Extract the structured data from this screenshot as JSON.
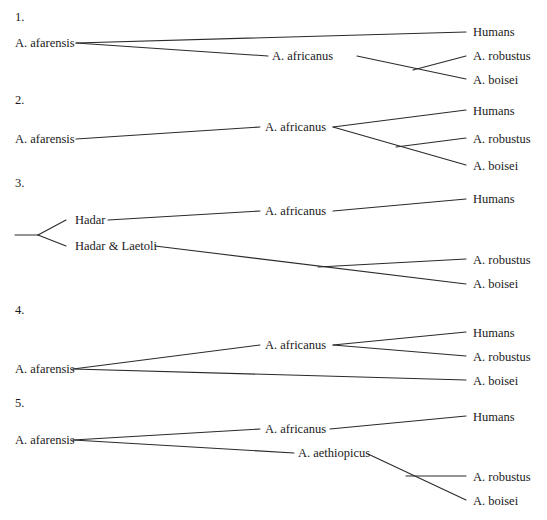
{
  "trees": [
    {
      "heading": "1.",
      "heading_pos": [
        15,
        21
      ],
      "labels": [
        {
          "text": "A. afarensis",
          "x": 15,
          "y": 47
        },
        {
          "text": "A. africanus",
          "x": 272,
          "y": 60
        },
        {
          "text": "Humans",
          "x": 473,
          "y": 36
        },
        {
          "text": "A. robustus",
          "x": 473,
          "y": 60
        },
        {
          "text": "A. boisei",
          "x": 473,
          "y": 84
        }
      ],
      "lines": [
        [
          76,
          43,
          466,
          32
        ],
        [
          76,
          43,
          268,
          56
        ],
        [
          357,
          56,
          466,
          79
        ],
        [
          413,
          70,
          466,
          56
        ]
      ]
    },
    {
      "heading": "2.",
      "heading_pos": [
        15,
        104
      ],
      "labels": [
        {
          "text": "A. afarensis",
          "x": 15,
          "y": 143
        },
        {
          "text": "A. africanus",
          "x": 265,
          "y": 131
        },
        {
          "text": "Humans",
          "x": 473,
          "y": 115
        },
        {
          "text": "A. robustus",
          "x": 473,
          "y": 143
        },
        {
          "text": "A. boisei",
          "x": 473,
          "y": 170
        }
      ],
      "lines": [
        [
          76,
          139,
          260,
          127
        ],
        [
          333,
          127,
          466,
          110
        ],
        [
          333,
          127,
          466,
          165
        ],
        [
          396,
          147,
          466,
          138
        ]
      ]
    },
    {
      "heading": "3.",
      "heading_pos": [
        15,
        187
      ],
      "labels": [
        {
          "text": "Hadar",
          "x": 75,
          "y": 224
        },
        {
          "text": "Hadar & Laetoli",
          "x": 75,
          "y": 250
        },
        {
          "text": "A. africanus",
          "x": 265,
          "y": 215
        },
        {
          "text": "Humans",
          "x": 473,
          "y": 203
        },
        {
          "text": "A. robustus",
          "x": 473,
          "y": 264
        },
        {
          "text": "A. boisei",
          "x": 473,
          "y": 288
        }
      ],
      "lines": [
        [
          15,
          235,
          38,
          235
        ],
        [
          38,
          235,
          66,
          220
        ],
        [
          38,
          235,
          66,
          246
        ],
        [
          108,
          220,
          260,
          211
        ],
        [
          333,
          211,
          466,
          199
        ],
        [
          155,
          246,
          466,
          284
        ],
        [
          318,
          267,
          466,
          259
        ]
      ]
    },
    {
      "heading": "4.",
      "heading_pos": [
        15,
        314
      ],
      "labels": [
        {
          "text": "A. afarensis",
          "x": 15,
          "y": 373
        },
        {
          "text": "A. africanus",
          "x": 265,
          "y": 349
        },
        {
          "text": "Humans",
          "x": 473,
          "y": 337
        },
        {
          "text": "A. robustus",
          "x": 473,
          "y": 361
        },
        {
          "text": "A. boisei",
          "x": 473,
          "y": 385
        }
      ],
      "lines": [
        [
          73,
          369,
          260,
          345
        ],
        [
          333,
          345,
          466,
          332
        ],
        [
          333,
          345,
          466,
          356
        ],
        [
          73,
          369,
          466,
          380
        ]
      ]
    },
    {
      "heading": "5.",
      "heading_pos": [
        15,
        407
      ],
      "labels": [
        {
          "text": "A. afarensis",
          "x": 15,
          "y": 444
        },
        {
          "text": "A. africanus",
          "x": 265,
          "y": 433
        },
        {
          "text": "A. aethiopicus",
          "x": 298,
          "y": 457
        },
        {
          "text": "Humans",
          "x": 473,
          "y": 421
        },
        {
          "text": "A. robustus",
          "x": 473,
          "y": 481
        },
        {
          "text": "A. boisei",
          "x": 473,
          "y": 505
        }
      ],
      "lines": [
        [
          73,
          440,
          260,
          429
        ],
        [
          330,
          429,
          466,
          416
        ],
        [
          73,
          440,
          294,
          453
        ],
        [
          368,
          454,
          466,
          500
        ],
        [
          406,
          476,
          466,
          476
        ]
      ]
    }
  ],
  "colors": {
    "line": "#2a2a2a",
    "text": "#1a1a1a",
    "background": "#ffffff"
  }
}
